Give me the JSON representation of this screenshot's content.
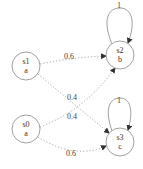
{
  "diagram": {
    "type": "markov-chain",
    "nodes": [
      {
        "id": "s0",
        "name": "s0",
        "label": "a",
        "cx": 26,
        "cy": 129
      },
      {
        "id": "s1",
        "name": "s1",
        "label": "a",
        "cx": 26,
        "cy": 66
      },
      {
        "id": "s2",
        "name": "s2",
        "label": "b",
        "cx": 120,
        "cy": 55
      },
      {
        "id": "s3",
        "name": "s3",
        "label": "c",
        "cx": 120,
        "cy": 142
      }
    ],
    "edges": [
      {
        "from": "s1",
        "to": "s2",
        "label": "0.6"
      },
      {
        "from": "s1",
        "to": "s3",
        "label": "0.4"
      },
      {
        "from": "s0",
        "to": "s2",
        "label": "0.4"
      },
      {
        "from": "s0",
        "to": "s3",
        "label": "0.6"
      },
      {
        "from": "s2",
        "to": "s2",
        "label": "1"
      },
      {
        "from": "s3",
        "to": "s3",
        "label": "1"
      }
    ],
    "colors": {
      "node_stroke": "#888888",
      "edge": "#999999",
      "text": "#333333"
    }
  }
}
